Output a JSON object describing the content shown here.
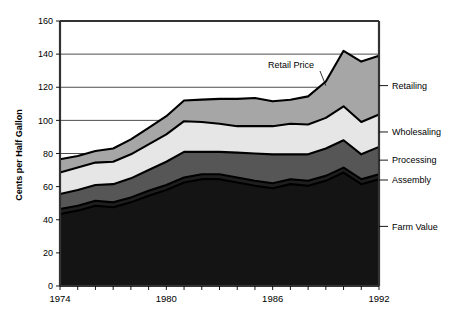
{
  "chart_data": {
    "type": "area",
    "title": "",
    "subtitle": "",
    "xlabel": "",
    "ylabel": "Cents per Half Gallon",
    "stacked": true,
    "grid": true,
    "legend_position": "right-outside",
    "xlim": [
      1974,
      1992
    ],
    "ylim": [
      0,
      160
    ],
    "y_ticks": [
      0,
      20,
      40,
      60,
      80,
      100,
      120,
      140,
      160
    ],
    "y_tick_labels": [
      "0",
      "20",
      "40",
      "60",
      "80",
      "100",
      "120",
      "140",
      "160"
    ],
    "x_ticks": [
      1974,
      1975,
      1976,
      1977,
      1978,
      1979,
      1980,
      1981,
      1982,
      1983,
      1984,
      1985,
      1986,
      1987,
      1988,
      1989,
      1990,
      1991,
      1992
    ],
    "x_tick_labels_shown": [
      "1974",
      "1980",
      "1986",
      "1992"
    ],
    "x_labeled_ticks": [
      1974,
      1980,
      1986,
      1992
    ],
    "x": [
      1974,
      1975,
      1976,
      1977,
      1978,
      1979,
      1980,
      1981,
      1982,
      1983,
      1984,
      1985,
      1986,
      1987,
      1988,
      1989,
      1990,
      1991,
      1992
    ],
    "series": [
      {
        "name": "Farm Value",
        "color": "#141414",
        "values": [
          43.5,
          45.5,
          48.5,
          47.5,
          50.5,
          54.5,
          58.0,
          62.5,
          64.5,
          64.5,
          62.5,
          60.5,
          59.0,
          61.5,
          60.5,
          63.5,
          68.5,
          61.5,
          64.5
        ]
      },
      {
        "name": "Assembly",
        "color": "#1e1e1e",
        "values": [
          3.0,
          3.0,
          3.0,
          3.0,
          3.0,
          3.0,
          3.0,
          3.0,
          3.0,
          3.0,
          3.0,
          3.0,
          3.0,
          3.0,
          3.0,
          3.0,
          3.0,
          3.0,
          3.0
        ]
      },
      {
        "name": "Processing",
        "color": "#565656",
        "values": [
          9.0,
          9.5,
          9.5,
          11.0,
          11.5,
          12.5,
          14.0,
          15.5,
          13.5,
          13.5,
          15.0,
          16.5,
          17.5,
          15.0,
          16.0,
          16.5,
          16.5,
          15.0,
          16.5
        ]
      },
      {
        "name": "Wholesaling",
        "color": "#e6e6e6",
        "values": [
          13.0,
          13.5,
          13.5,
          13.5,
          14.5,
          15.5,
          16.5,
          18.5,
          18.0,
          17.0,
          16.0,
          16.5,
          17.0,
          18.5,
          18.0,
          18.5,
          20.5,
          19.5,
          19.5
        ]
      },
      {
        "name": "Retailing",
        "color": "#a6a6a6",
        "values": [
          8.0,
          7.0,
          7.0,
          8.0,
          9.0,
          10.0,
          11.0,
          12.5,
          13.5,
          15.0,
          16.5,
          17.0,
          15.0,
          14.5,
          17.0,
          22.0,
          33.5,
          36.5,
          35.5
        ]
      }
    ],
    "stack_tops": {
      "farm_value": [
        43.5,
        45.5,
        48.5,
        47.5,
        50.5,
        54.5,
        58.0,
        62.5,
        64.5,
        64.5,
        62.5,
        60.5,
        59.0,
        61.5,
        60.5,
        63.5,
        68.5,
        61.5,
        64.5
      ],
      "assembly": [
        46.5,
        48.5,
        51.5,
        50.5,
        53.5,
        57.5,
        61.0,
        65.5,
        67.5,
        67.5,
        65.5,
        63.5,
        62.0,
        64.5,
        63.5,
        66.5,
        71.5,
        64.5,
        67.5
      ],
      "processing": [
        55.5,
        58.0,
        61.0,
        61.5,
        65.0,
        70.0,
        75.0,
        81.0,
        81.0,
        81.0,
        80.5,
        80.0,
        79.5,
        79.5,
        79.5,
        83.0,
        88.0,
        79.5,
        84.0
      ],
      "wholesaling": [
        68.5,
        71.5,
        74.5,
        75.0,
        79.5,
        85.5,
        91.5,
        99.5,
        99.0,
        98.0,
        96.5,
        96.5,
        96.5,
        98.0,
        97.5,
        101.5,
        108.5,
        99.0,
        103.5
      ],
      "retail_price": [
        76.5,
        78.5,
        81.5,
        83.0,
        88.5,
        95.5,
        102.5,
        112.0,
        112.5,
        113.0,
        113.0,
        113.5,
        111.5,
        112.5,
        114.5,
        123.5,
        142.0,
        135.5,
        139.0
      ]
    },
    "annotations": [
      {
        "text": "Retail Price",
        "target_x": 1989,
        "target_y": 121
      }
    ],
    "right_labels": [
      {
        "name": "Retailing",
        "y": 121
      },
      {
        "name": "Wholesaling",
        "y": 93
      },
      {
        "name": "Processing",
        "y": 76
      },
      {
        "name": "Assembly",
        "y": 64
      },
      {
        "name": "Farm Value",
        "y": 36
      }
    ]
  },
  "colors": {
    "background": "#ffffff",
    "axis": "#333333",
    "grid": "#000000",
    "text": "#000000",
    "farm_value": "#141414",
    "assembly": "#1e1e1e",
    "processing": "#565656",
    "wholesaling": "#e6e6e6",
    "retailing": "#a6a6a6"
  }
}
